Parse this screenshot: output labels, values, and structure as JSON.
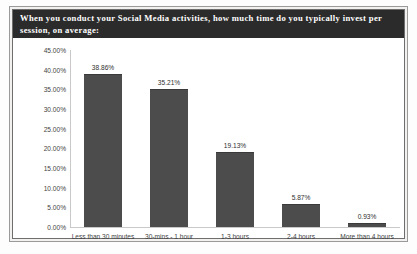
{
  "chart_data": {
    "type": "bar",
    "title": "When you conduct your Social Media activities, how much time do you typically invest per session, on average:",
    "categories": [
      "Less than 30 minutes",
      "30-mins - 1 hour",
      "1-3 hours",
      "2-4 hours",
      "More than 4 hours"
    ],
    "values": [
      38.86,
      35.21,
      19.13,
      5.87,
      0.93
    ],
    "data_labels": [
      "38.86%",
      "35.21%",
      "19.13%",
      "5.87%",
      "0.93%"
    ],
    "xlabel": "",
    "ylabel": "",
    "ylim": [
      0,
      45
    ],
    "ytick_values": [
      0,
      5,
      10,
      15,
      20,
      25,
      30,
      35,
      40,
      45
    ],
    "ytick_labels": [
      "0.00%",
      "5.00%",
      "10.00%",
      "15.00%",
      "20.00%",
      "25.00%",
      "30.00%",
      "35.00%",
      "40.00%",
      "45.00%"
    ],
    "grid": false,
    "legend": "none",
    "bar_color": "#4c4c4c",
    "title_background": "#2b2b2b",
    "title_color": "#ffffff"
  }
}
